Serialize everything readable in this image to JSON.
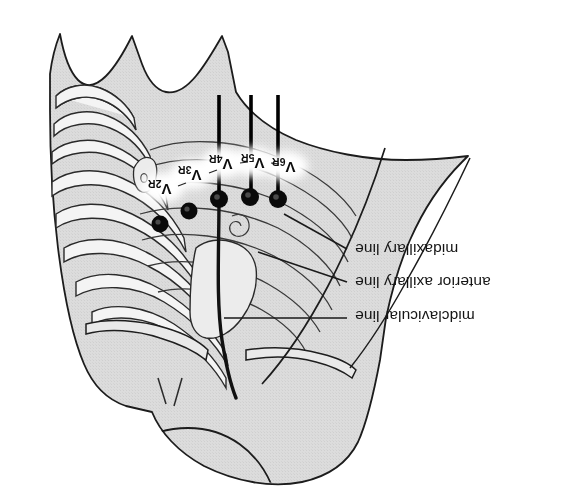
{
  "figure": {
    "title_text": "",
    "orientation_note": "image content rendered rotated 180 degrees",
    "colors": {
      "background": "#ffffff",
      "skin_fill": "#d9d9d9",
      "bone_fill": "#f2f2f2",
      "outline": "#1a1a1a",
      "electrode": "#000000",
      "label_halo": "#ffffff",
      "text": "#151515"
    }
  },
  "electrodes": [
    {
      "id": "V2R",
      "base": "V",
      "sub": "2R",
      "cx": 160,
      "cy": 224,
      "r": 8.5,
      "label_x": 171,
      "label_y": 191
    },
    {
      "id": "V3R",
      "base": "V",
      "sub": "3R",
      "cx": 189,
      "cy": 211,
      "r": 8.5,
      "label_x": 199,
      "label_y": 176
    },
    {
      "id": "V4R",
      "base": "V",
      "sub": "4R",
      "cx": 219,
      "cy": 199,
      "r": 9,
      "label_x": 230,
      "label_y": 165
    },
    {
      "id": "V5R",
      "base": "V",
      "sub": "5R",
      "cx": 250,
      "cy": 197,
      "r": 9,
      "label_x": 262,
      "label_y": 164
    },
    {
      "id": "V6R",
      "base": "V",
      "sub": "6R",
      "cx": 278,
      "cy": 199,
      "r": 9,
      "label_x": 293,
      "label_y": 168
    }
  ],
  "reference_lines": [
    {
      "name": "midclavicular line",
      "x": 219,
      "y_top": 95,
      "y_bottom": 199
    },
    {
      "name": "anterior axillary line",
      "x": 251,
      "y_top": 95,
      "y_bottom": 197
    },
    {
      "name": "midaxillary line",
      "x": 278,
      "y_top": 95,
      "y_bottom": 199
    }
  ],
  "annotations": [
    {
      "id": "midaxillary",
      "text": "midaxillary line",
      "text_right": 490,
      "baseline_y": 254,
      "leader": {
        "x1": 284,
        "y1": 215,
        "x2": 347,
        "y2": 249
      }
    },
    {
      "id": "anterior-axillary",
      "text": "anterior axillary line",
      "text_right": 513,
      "baseline_y": 288,
      "leader": {
        "x1": 256,
        "y1": 252,
        "x2": 347,
        "y2": 282
      }
    },
    {
      "id": "midclavicular",
      "text": "midclavicular line",
      "text_right": 500,
      "baseline_y": 322,
      "leader": {
        "x1": 222,
        "y1": 318,
        "x2": 347,
        "y2": 318
      }
    }
  ],
  "rib_numbers": [
    "1",
    "2",
    "3",
    "4",
    "5",
    "6",
    "7",
    "8"
  ]
}
